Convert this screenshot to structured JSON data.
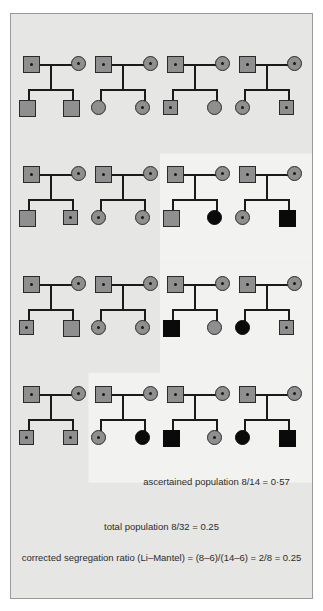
{
  "figure": {
    "background_color": "#e6e6e4",
    "border_color": "#9a9a98",
    "highlight_color": "#f2f2f0",
    "symbol_fill_unaffected": "#8f8f8f",
    "symbol_fill_affected": "#0a0a0a",
    "symbol_stroke": "#2a2a2a",
    "line_color": "#1a1a1a"
  },
  "legend_semantics": {
    "square": "male",
    "circle": "female",
    "center_dot": "carrier (heterozygote)",
    "solid_black": "affected (homozygote)",
    "plain_gray": "unaffected non-carrier"
  },
  "rows": [
    {
      "row_index": 1,
      "families": [
        {
          "id": "f1",
          "father": {
            "shape": "square",
            "state": "carrier"
          },
          "mother": {
            "shape": "circle",
            "state": "carrier"
          },
          "children": [
            {
              "shape": "square",
              "state": "plain"
            },
            {
              "shape": "square",
              "state": "plain"
            }
          ]
        },
        {
          "id": "f2",
          "father": {
            "shape": "square",
            "state": "carrier"
          },
          "mother": {
            "shape": "circle",
            "state": "carrier"
          },
          "children": [
            {
              "shape": "circle",
              "state": "plain"
            },
            {
              "shape": "circle",
              "state": "carrier"
            }
          ]
        },
        {
          "id": "f3",
          "father": {
            "shape": "square",
            "state": "carrier"
          },
          "mother": {
            "shape": "circle",
            "state": "carrier"
          },
          "children": [
            {
              "shape": "square",
              "state": "carrier"
            },
            {
              "shape": "circle",
              "state": "plain"
            }
          ]
        },
        {
          "id": "f4",
          "father": {
            "shape": "square",
            "state": "carrier"
          },
          "mother": {
            "shape": "circle",
            "state": "carrier"
          },
          "children": [
            {
              "shape": "circle",
              "state": "carrier"
            },
            {
              "shape": "square",
              "state": "carrier"
            }
          ]
        }
      ]
    },
    {
      "row_index": 2,
      "families": [
        {
          "id": "f5",
          "father": {
            "shape": "square",
            "state": "carrier"
          },
          "mother": {
            "shape": "circle",
            "state": "carrier"
          },
          "children": [
            {
              "shape": "square",
              "state": "plain"
            },
            {
              "shape": "square",
              "state": "carrier"
            }
          ]
        },
        {
          "id": "f6",
          "father": {
            "shape": "square",
            "state": "carrier"
          },
          "mother": {
            "shape": "circle",
            "state": "carrier"
          },
          "children": [
            {
              "shape": "circle",
              "state": "carrier"
            },
            {
              "shape": "circle",
              "state": "carrier"
            }
          ]
        },
        {
          "id": "f7",
          "father": {
            "shape": "square",
            "state": "carrier"
          },
          "mother": {
            "shape": "circle",
            "state": "carrier"
          },
          "children": [
            {
              "shape": "square",
              "state": "plain"
            },
            {
              "shape": "circle",
              "state": "affected"
            }
          ]
        },
        {
          "id": "f8",
          "father": {
            "shape": "square",
            "state": "carrier"
          },
          "mother": {
            "shape": "circle",
            "state": "carrier"
          },
          "children": [
            {
              "shape": "circle",
              "state": "carrier"
            },
            {
              "shape": "square",
              "state": "affected"
            }
          ]
        }
      ]
    },
    {
      "row_index": 3,
      "families": [
        {
          "id": "f9",
          "father": {
            "shape": "square",
            "state": "carrier"
          },
          "mother": {
            "shape": "circle",
            "state": "carrier"
          },
          "children": [
            {
              "shape": "square",
              "state": "carrier"
            },
            {
              "shape": "square",
              "state": "plain"
            }
          ]
        },
        {
          "id": "f10",
          "father": {
            "shape": "square",
            "state": "carrier"
          },
          "mother": {
            "shape": "circle",
            "state": "carrier"
          },
          "children": [
            {
              "shape": "circle",
              "state": "carrier"
            },
            {
              "shape": "circle",
              "state": "carrier"
            }
          ]
        },
        {
          "id": "f11",
          "father": {
            "shape": "square",
            "state": "carrier"
          },
          "mother": {
            "shape": "circle",
            "state": "carrier"
          },
          "children": [
            {
              "shape": "square",
              "state": "affected"
            },
            {
              "shape": "circle",
              "state": "plain"
            }
          ]
        },
        {
          "id": "f12",
          "father": {
            "shape": "square",
            "state": "carrier"
          },
          "mother": {
            "shape": "circle",
            "state": "carrier"
          },
          "children": [
            {
              "shape": "circle",
              "state": "affected"
            },
            {
              "shape": "square",
              "state": "carrier"
            }
          ]
        }
      ]
    },
    {
      "row_index": 4,
      "families": [
        {
          "id": "f13",
          "father": {
            "shape": "square",
            "state": "carrier"
          },
          "mother": {
            "shape": "circle",
            "state": "carrier"
          },
          "children": [
            {
              "shape": "square",
              "state": "carrier"
            },
            {
              "shape": "square",
              "state": "carrier"
            }
          ]
        },
        {
          "id": "f14",
          "father": {
            "shape": "square",
            "state": "carrier"
          },
          "mother": {
            "shape": "circle",
            "state": "carrier"
          },
          "children": [
            {
              "shape": "circle",
              "state": "carrier"
            },
            {
              "shape": "circle",
              "state": "affected"
            }
          ]
        },
        {
          "id": "f15",
          "father": {
            "shape": "square",
            "state": "carrier"
          },
          "mother": {
            "shape": "circle",
            "state": "carrier"
          },
          "children": [
            {
              "shape": "square",
              "state": "affected"
            },
            {
              "shape": "circle",
              "state": "carrier"
            }
          ]
        },
        {
          "id": "f16",
          "father": {
            "shape": "square",
            "state": "carrier"
          },
          "mother": {
            "shape": "circle",
            "state": "carrier"
          },
          "children": [
            {
              "shape": "circle",
              "state": "affected"
            },
            {
              "shape": "square",
              "state": "affected"
            }
          ]
        }
      ]
    }
  ],
  "captions": {
    "ascertained": "ascertained population 8/14 = 0·57",
    "total": "total population 8/32 = 0.25",
    "corrected": "corrected segregation ratio (Li–Mantel) = (8–6)/(14–6) = 2/8 = 0.25"
  },
  "chart_data": {
    "type": "diagram",
    "sibship_count": 16,
    "children_per_sibship": 2,
    "total_children": 32,
    "affected_children": 8,
    "ascertained_sibships": 7,
    "ascertained_children": 14,
    "ascertained_affected": 8,
    "total_population_ratio": 0.25,
    "ascertained_population_ratio": 0.57,
    "corrected_segregation_ratio": 0.25,
    "li_mantel_numerator": 2,
    "li_mantel_denominator": 8
  }
}
